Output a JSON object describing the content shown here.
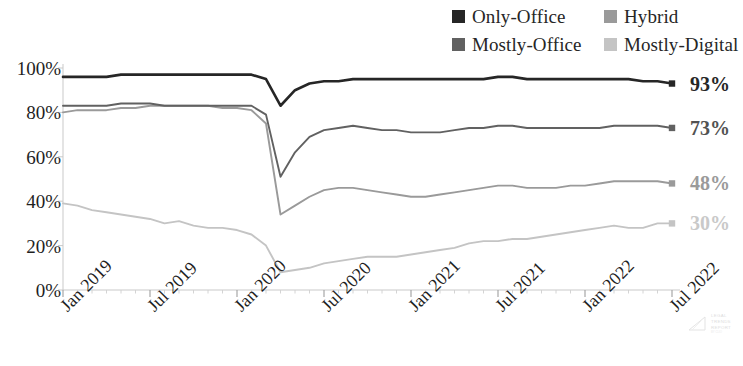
{
  "legend": {
    "items": [
      {
        "label": "Only-Office",
        "color": "#262626",
        "key": "only_office"
      },
      {
        "label": "Hybrid",
        "color": "#9a9a9a",
        "key": "hybrid"
      },
      {
        "label": "Mostly-Office",
        "color": "#616161",
        "key": "mostly_office"
      },
      {
        "label": "Mostly-Digital",
        "color": "#c4c4c4",
        "key": "mostly_digital"
      }
    ]
  },
  "end_labels": [
    {
      "text": "93%",
      "color": "#262626",
      "series": "Only-Office"
    },
    {
      "text": "73%",
      "color": "#525252",
      "series": "Mostly-Office"
    },
    {
      "text": "48%",
      "color": "#9a9a9a",
      "series": "Hybrid"
    },
    {
      "text": "30%",
      "color": "#c9c9c9",
      "series": "Mostly-Digital"
    }
  ],
  "watermark": {
    "line1": "LEGAL",
    "line2": "TRENDS",
    "line3": "REPORT",
    "sub": "BY CLIO"
  },
  "chart_data": {
    "type": "line",
    "title": "",
    "subtitle": "",
    "xlabel": "",
    "ylabel": "",
    "ylim": [
      0,
      100
    ],
    "ytick_values": [
      0,
      20,
      40,
      60,
      80,
      100
    ],
    "ytick_labels": [
      "0%",
      "20%",
      "40%",
      "60%",
      "80%",
      "100%"
    ],
    "y_unit": "percent",
    "grid": false,
    "legend_position": "top-right",
    "x_major_labels": [
      "Jan 2019",
      "Jul 2019",
      "Jan 2020",
      "Jul 2020",
      "Jan 2021",
      "Jul 2021",
      "Jan 2022",
      "Jul 2022"
    ],
    "x_major_indices": [
      0,
      6,
      12,
      18,
      24,
      30,
      36,
      42
    ],
    "x_tick_rotation": -45,
    "x": [
      "Jan 2019",
      "Feb 2019",
      "Mar 2019",
      "Apr 2019",
      "May 2019",
      "Jun 2019",
      "Jul 2019",
      "Aug 2019",
      "Sep 2019",
      "Oct 2019",
      "Nov 2019",
      "Dec 2019",
      "Jan 2020",
      "Feb 2020",
      "Mar 2020",
      "Apr 2020",
      "May 2020",
      "Jun 2020",
      "Jul 2020",
      "Aug 2020",
      "Sep 2020",
      "Oct 2020",
      "Nov 2020",
      "Dec 2020",
      "Jan 2021",
      "Feb 2021",
      "Mar 2021",
      "Apr 2021",
      "May 2021",
      "Jun 2021",
      "Jul 2021",
      "Aug 2021",
      "Sep 2021",
      "Oct 2021",
      "Nov 2021",
      "Dec 2021",
      "Jan 2022",
      "Feb 2022",
      "Mar 2022",
      "Apr 2022",
      "May 2022",
      "Jun 2022",
      "Jul 2022"
    ],
    "series": [
      {
        "name": "Only-Office",
        "color": "#262626",
        "end_value": 93,
        "values": [
          96,
          96,
          96,
          96,
          97,
          97,
          97,
          97,
          97,
          97,
          97,
          97,
          97,
          97,
          95,
          83,
          90,
          93,
          94,
          94,
          95,
          95,
          95,
          95,
          95,
          95,
          95,
          95,
          95,
          95,
          96,
          96,
          95,
          95,
          95,
          95,
          95,
          95,
          95,
          95,
          94,
          94,
          93
        ]
      },
      {
        "name": "Mostly-Office",
        "color": "#616161",
        "end_value": 73,
        "values": [
          83,
          83,
          83,
          83,
          84,
          84,
          84,
          83,
          83,
          83,
          83,
          83,
          83,
          83,
          79,
          51,
          62,
          69,
          72,
          73,
          74,
          73,
          72,
          72,
          71,
          71,
          71,
          72,
          73,
          73,
          74,
          74,
          73,
          73,
          73,
          73,
          73,
          73,
          74,
          74,
          74,
          74,
          73
        ]
      },
      {
        "name": "Hybrid",
        "color": "#9a9a9a",
        "end_value": 48,
        "values": [
          80,
          81,
          81,
          81,
          82,
          82,
          83,
          83,
          83,
          83,
          83,
          82,
          82,
          81,
          75,
          34,
          38,
          42,
          45,
          46,
          46,
          45,
          44,
          43,
          42,
          42,
          43,
          44,
          45,
          46,
          47,
          47,
          46,
          46,
          46,
          47,
          47,
          48,
          49,
          49,
          49,
          49,
          48
        ]
      },
      {
        "name": "Mostly-Digital",
        "color": "#c4c4c4",
        "end_value": 30,
        "values": [
          39,
          38,
          36,
          35,
          34,
          33,
          32,
          30,
          31,
          29,
          28,
          28,
          27,
          25,
          20,
          8,
          9,
          10,
          12,
          13,
          14,
          15,
          15,
          15,
          16,
          17,
          18,
          19,
          21,
          22,
          22,
          23,
          23,
          24,
          25,
          26,
          27,
          28,
          29,
          28,
          28,
          30,
          30
        ]
      }
    ]
  }
}
